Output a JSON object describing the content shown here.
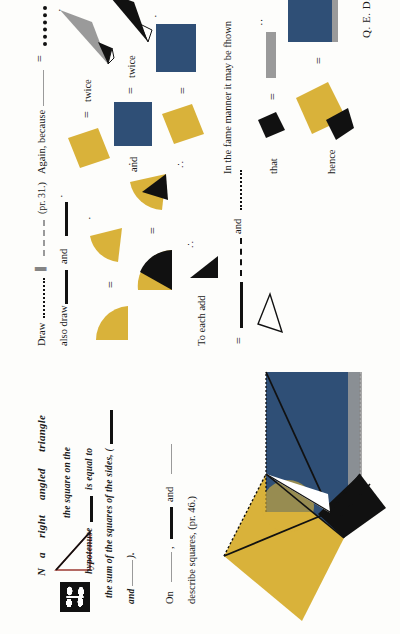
{
  "page": {
    "source_work": "Byrne's Euclid, Book I, Proposition XLVII",
    "orientation": "rotated-90-ccw",
    "background": "#fdfdfb"
  },
  "colors": {
    "red": "#9c3a33",
    "blue": "#2f4f76",
    "yellow": "#d9b23a",
    "black": "#111111",
    "grey_light": "#9a9a9a",
    "paper": "#fdfdfb",
    "ink": "#1a1a1a"
  },
  "dropcap": {
    "letter": "N",
    "ornament_name": "decorative-initial-block"
  },
  "enunciation": {
    "line1_a": "N",
    "line1_b": "a",
    "line1_c": "right",
    "line1_d": "angled",
    "line1_e": "triangle",
    "line2_a": "the square on the",
    "line3_a": "hypotenuse",
    "line3_b": "is equal to",
    "line4_a": "the sum of the squares of the sides, (",
    "line5_a": "and",
    "line5_b": ").",
    "full_text": "IN a right angled triangle the square on the hypotenuse is equal to the sum of the squares of the sides."
  },
  "construction": {
    "on_label": "On",
    "comma": ",",
    "and_label": "and",
    "describe_label": "describe squares, (pr. 46.)",
    "reference_46": "(pr. 46.)",
    "draw_label": "Draw",
    "parallel_symbol": "∥",
    "reference_31": "(pr. 31.)",
    "also_draw_label": "also draw",
    "also_and_label": "and",
    "to_each_add_label": "To each add",
    "therefore_symbol": "∴",
    "equals_symbol": "=",
    "and_label2": "and"
  },
  "demonstration": {
    "again_because": "Again, because",
    "equals": "=",
    "twice_1": "twice",
    "and_1": "and",
    "twice_2": "twice",
    "therefore": "∴",
    "equals_2": "=",
    "same_manner": "In the fame manner it may be fhown",
    "that": "that",
    "equals_3": "=",
    "hence": "hence",
    "equals_4": "=",
    "qed": "Q. E. D."
  },
  "marks": {
    "dot_one": "·",
    "dot_two": "··",
    "therefore_dots": "∴"
  }
}
